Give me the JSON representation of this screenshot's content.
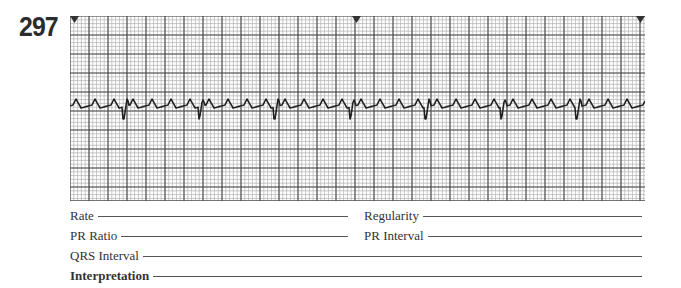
{
  "strip": {
    "number": "297",
    "grid": {
      "minor_px": 3.8,
      "major_px": 19,
      "minor_color": "#b0b0b0",
      "major_color": "#4a4a4a"
    },
    "markers": [
      "left-triangle-marker",
      "center-triangle-marker",
      "right-triangle-marker"
    ],
    "rhythm": {
      "flutter_wave_spacing_px": 19,
      "qrs_spacing_px": 75.5,
      "conduction_ratio_visual": "4:1"
    }
  },
  "form": {
    "rate_label": "Rate",
    "regularity_label": "Regularity",
    "pr_ratio_label": "PR Ratio",
    "pr_interval_label": "PR Interval",
    "qrs_interval_label": "QRS Interval",
    "interpretation_label": "Interpretation",
    "rate_value": "",
    "regularity_value": "",
    "pr_ratio_value": "",
    "pr_interval_value": "",
    "qrs_interval_value": "",
    "interpretation_value": ""
  }
}
